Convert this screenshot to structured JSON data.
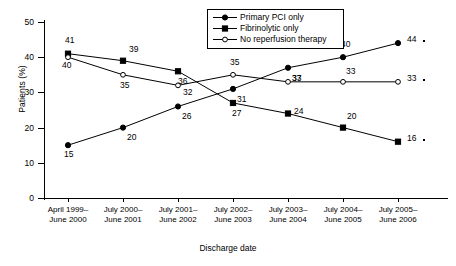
{
  "chart_data": {
    "type": "line",
    "title": "",
    "xlabel": "Discharge date",
    "ylabel": "Patients (%)",
    "ylim": [
      0,
      50
    ],
    "yticks": [
      0,
      10,
      20,
      30,
      40,
      50
    ],
    "grid": false,
    "legend_position": "top-center",
    "categories": [
      "April 1999– June 2000",
      "July 2000– June 2001",
      "July 2001– June 2002",
      "July 2002– June 2003",
      "July 2003– June 2004",
      "July 2004– June 2005",
      "July 2005– June 2006"
    ],
    "category_lines": [
      [
        "April 1999–",
        "June 2000"
      ],
      [
        "July 2000–",
        "June 2001"
      ],
      [
        "July 2001–",
        "June 2002"
      ],
      [
        "July 2002–",
        "June 2003"
      ],
      [
        "July 2003–",
        "June 2004"
      ],
      [
        "July 2004–",
        "June 2005"
      ],
      [
        "July 2005–",
        "June 2006"
      ]
    ],
    "series": [
      {
        "name": "Primary PCI only",
        "marker": "filled-circle",
        "values": [
          15,
          20,
          26,
          31,
          37,
          40,
          44
        ]
      },
      {
        "name": "Fibrinolytic only",
        "marker": "filled-square",
        "values": [
          41,
          39,
          36,
          27,
          24,
          20,
          16
        ]
      },
      {
        "name": "No reperfusion therapy",
        "marker": "open-circle",
        "values": [
          40,
          35,
          32,
          35,
          33,
          33,
          33
        ]
      }
    ]
  },
  "axes": {
    "y_title": "Patients (%)",
    "x_title": "Discharge date",
    "y_tick_labels": [
      "0",
      "10",
      "20",
      "30",
      "40",
      "50"
    ]
  },
  "legend": {
    "entries": [
      {
        "label": "Primary PCI only",
        "marker": "filled-circle"
      },
      {
        "label": "Fibrinolytic only",
        "marker": "filled-square"
      },
      {
        "label": "No reperfusion therapy",
        "marker": "open-circle"
      }
    ]
  },
  "colors": {
    "line": "#000000",
    "background": "#ffffff",
    "marker_fill": "#000000",
    "marker_open_fill": "#ffffff"
  }
}
